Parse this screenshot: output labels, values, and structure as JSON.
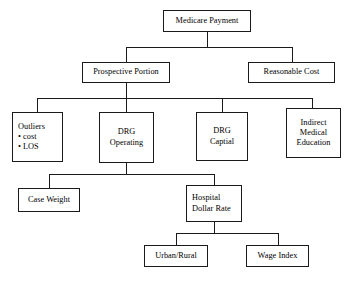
{
  "diagram": {
    "title": "Medicare Payment",
    "type": "hierarchy-tree",
    "nodes": [
      {
        "id": "medicare-payment",
        "label": "Medicare Payment",
        "lines": [
          "Medicare Payment"
        ],
        "level": 0
      },
      {
        "id": "prospective-portion",
        "label": "Prospective Portion",
        "lines": [
          "Prospective Portion"
        ],
        "level": 1
      },
      {
        "id": "reasonable-cost",
        "label": "Reasonable Cost",
        "lines": [
          "Reasonable Cost"
        ],
        "level": 1
      },
      {
        "id": "outliers",
        "label": "Outliers",
        "lines": [
          "Outliers"
        ],
        "bullets": [
          "cost",
          "LOS"
        ],
        "level": 2
      },
      {
        "id": "drg-operating",
        "label": "DRG Operating",
        "lines": [
          "DRG",
          "Operating"
        ],
        "level": 2
      },
      {
        "id": "drg-captial",
        "label": "DRG Captial",
        "lines": [
          "DRG",
          "Captial"
        ],
        "level": 2
      },
      {
        "id": "indirect-medical-education",
        "label": "Indirect Medical Education",
        "lines": [
          "Indirect",
          "Medical",
          "Education"
        ],
        "level": 2
      },
      {
        "id": "case-weight",
        "label": "Case Weight",
        "lines": [
          "Case Weight"
        ],
        "level": 3
      },
      {
        "id": "hospital-dollar-rate",
        "label": "Hospital Dollar Rate",
        "lines": [
          "Hospital",
          "Dollar Rate"
        ],
        "level": 3
      },
      {
        "id": "urban-rural",
        "label": "Urban/Rural",
        "lines": [
          "Urban/Rural"
        ],
        "level": 4
      },
      {
        "id": "wage-index",
        "label": "Wage Index",
        "lines": [
          "Wage Index"
        ],
        "level": 4
      }
    ],
    "edges": [
      {
        "from": "medicare-payment",
        "to": "prospective-portion"
      },
      {
        "from": "medicare-payment",
        "to": "reasonable-cost"
      },
      {
        "from": "prospective-portion",
        "to": "outliers"
      },
      {
        "from": "prospective-portion",
        "to": "drg-operating"
      },
      {
        "from": "prospective-portion",
        "to": "drg-captial"
      },
      {
        "from": "prospective-portion",
        "to": "indirect-medical-education"
      },
      {
        "from": "drg-operating",
        "to": "case-weight"
      },
      {
        "from": "drg-operating",
        "to": "hospital-dollar-rate"
      },
      {
        "from": "hospital-dollar-rate",
        "to": "urban-rural"
      },
      {
        "from": "hospital-dollar-rate",
        "to": "wage-index"
      }
    ],
    "bullet_glyph": "•",
    "colors": {
      "background": "#ffffff",
      "stroke": "#1a1a1a",
      "text": "#000000"
    }
  },
  "labels": {
    "medicare_payment": "Medicare Payment",
    "prospective_portion": "Prospective Portion",
    "reasonable_cost": "Reasonable Cost",
    "outliers_title": "Outliers",
    "outliers_bullet_1": "• cost",
    "outliers_bullet_2": "• LOS",
    "drg_operating_l1": "DRG",
    "drg_operating_l2": "Operating",
    "drg_captial_l1": "DRG",
    "drg_captial_l2": "Captial",
    "indirect_l1": "Indirect",
    "indirect_l2": "Medical",
    "indirect_l3": "Education",
    "case_weight": "Case Weight",
    "hospital_l1": "Hospital",
    "hospital_l2": "Dollar Rate",
    "urban_rural": "Urban/Rural",
    "wage_index": "Wage Index"
  }
}
